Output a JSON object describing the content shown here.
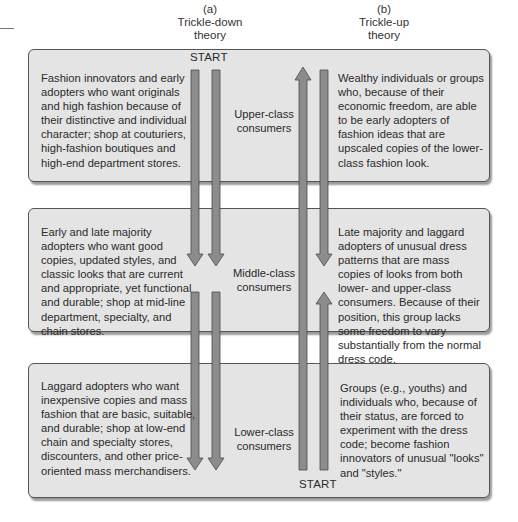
{
  "headers": {
    "left": {
      "letter": "(a)",
      "line1": "Trickle-down",
      "line2": "theory"
    },
    "right": {
      "letter": "(b)",
      "line1": "Trickle-up",
      "line2": "theory"
    }
  },
  "start_labels": {
    "top": "START",
    "bottom": "START"
  },
  "tiers": [
    {
      "class_line1": "Upper-class",
      "class_line2": "consumers",
      "left_text": "Fashion innovators and early adopters who want originals and high fashion because of their distinctive and individual character; shop at couturiers, high-fashion boutiques and high-end department stores.",
      "right_text": "Wealthy individuals or groups who, because of their economic freedom, are able to be early adopters of fashion ideas that are upscaled copies of the lower-class fashion look."
    },
    {
      "class_line1": "Middle-class",
      "class_line2": "consumers",
      "left_text": "Early and late majority adopters who want good copies, updated styles, and classic looks that are current and appropriate, yet functional and durable; shop at mid-line department, specialty, and chain stores.",
      "right_text": "Late majority and laggard adopters of unusual dress patterns that are mass copies of looks from both lower- and upper-class consumers. Because of their position, this group lacks some freedom to vary substantially from the normal dress code."
    },
    {
      "class_line1": "Lower-class",
      "class_line2": "consumers",
      "left_text": "Laggard adopters who want inexpensive copies and mass fashion that are basic, suitable, and durable; shop at low-end chain and specialty stores, discounters, and other price-oriented mass merchandisers.",
      "right_text": "Groups (e.g., youths) and individuals who, because of their status, are forced to experiment with the dress code; become fashion innovators of unusual \"looks\" and \"styles.\""
    }
  ],
  "colors": {
    "box_fill": "#e4e4e4",
    "box_border": "#555555",
    "arrow_fill": "#8c8c8c",
    "arrow_stroke": "#4a4a4a"
  }
}
